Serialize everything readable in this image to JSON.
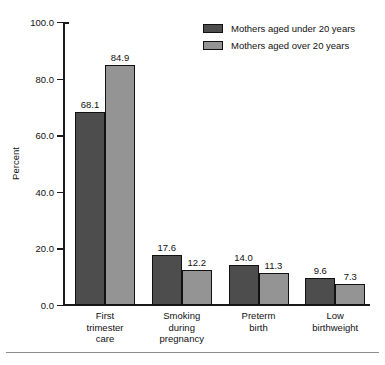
{
  "chart_data": {
    "type": "bar",
    "title": "",
    "subtitle": "",
    "xlabel": "",
    "ylabel": "Percent",
    "ylim": [
      0,
      100
    ],
    "ytick_labels": [
      "0.0",
      "20.0",
      "40.0",
      "60.0",
      "80.0",
      "100.0"
    ],
    "ytick_values": [
      0,
      20,
      40,
      60,
      80,
      100
    ],
    "grid": false,
    "legend_position": "top-right",
    "categories": [
      "First trimester care",
      "Smoking during pregnancy",
      "Preterm birth",
      "Low birthweight"
    ],
    "category_label_lines": [
      [
        "First",
        "trimester",
        "care"
      ],
      [
        "Smoking",
        "during",
        "pregnancy"
      ],
      [
        "Preterm",
        "birth"
      ],
      [
        "Low",
        "birthweight"
      ]
    ],
    "series": [
      {
        "name": "Mothers aged under 20 years",
        "color": "#4d4d4d",
        "values": [
          68.1,
          17.6,
          14.0,
          9.6
        ],
        "value_labels": [
          "68.1",
          "17.6",
          "14.0",
          "9.6"
        ]
      },
      {
        "name": "Mothers aged over 20 years",
        "color": "#949494",
        "values": [
          84.9,
          12.2,
          11.3,
          7.3
        ],
        "value_labels": [
          "84.9",
          "12.2",
          "11.3",
          "7.3"
        ]
      }
    ]
  },
  "legend": {
    "items": [
      {
        "label": "Mothers aged under 20 years",
        "color": "#4d4d4d"
      },
      {
        "label": "Mothers aged over 20 years",
        "color": "#949494"
      }
    ]
  },
  "colors": {
    "series_dark": "#4d4d4d",
    "series_light": "#949494",
    "axis": "#1a1a1a",
    "text": "#111111",
    "rule": "#8c8c8c",
    "background": "#ffffff"
  }
}
